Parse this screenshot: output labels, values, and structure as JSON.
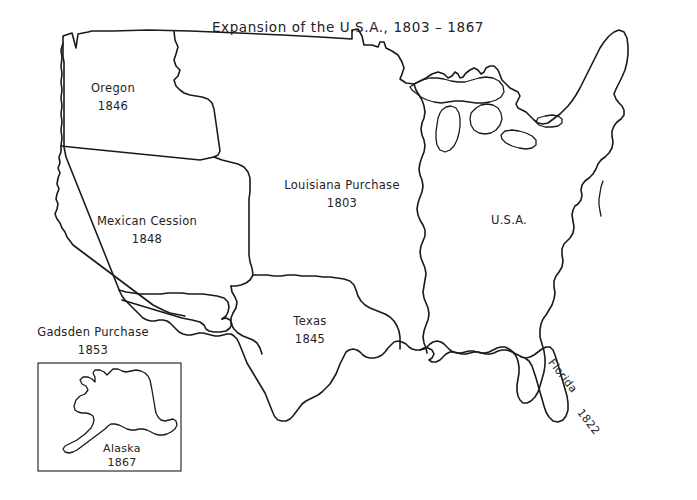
{
  "document": {
    "title": "Expansion of the U.S.A.,  1803 – 1867",
    "background_color": "#ffffff",
    "ink_color": "#1a1a1a",
    "width": 697,
    "height": 500
  },
  "map": {
    "kind": "outline-map",
    "region": "United States territorial expansion",
    "territories": [
      {
        "id": "oregon",
        "name": "Oregon",
        "year": "1846",
        "label_x": 113,
        "label_y": 92
      },
      {
        "id": "mexican-cession",
        "name": "Mexican Cession",
        "year": "1848",
        "label_x": 147,
        "label_y": 225
      },
      {
        "id": "gadsden-purchase",
        "name": "Gadsden Purchase",
        "year": "1853",
        "label_x": 93,
        "label_y": 336
      },
      {
        "id": "louisiana-purchase",
        "name": "Louisiana Purchase",
        "year": "1803",
        "label_x": 342,
        "label_y": 189
      },
      {
        "id": "texas",
        "name": "Texas",
        "year": "1845",
        "label_x": 310,
        "label_y": 325
      },
      {
        "id": "usa",
        "name": "U.S.A.",
        "year": "",
        "label_x": 509,
        "label_y": 224
      },
      {
        "id": "florida",
        "name": "Florida",
        "year": "1822",
        "label_x": 560,
        "label_y": 378,
        "rotation": 52
      },
      {
        "id": "alaska",
        "name": "Alaska",
        "year": "1867",
        "label_x": 122,
        "label_y": 452
      }
    ]
  },
  "inset": {
    "name": "Alaska inset",
    "frame": {
      "x": 38,
      "y": 363,
      "width": 143,
      "height": 108
    }
  }
}
